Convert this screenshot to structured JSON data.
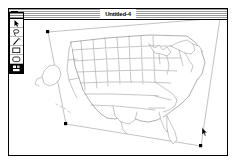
{
  "app": {
    "platform_style": "classic-mac-os",
    "background_color": "#ffffff"
  },
  "window": {
    "title": "Untitled-4",
    "close_box_label": "Close",
    "titlebar_stripe_color": "#9a9a9a",
    "frame_color": "#000000",
    "canvas_background": "#ffffff"
  },
  "palette": {
    "grip_label": "Drag palette",
    "tools": [
      {
        "name": "pointer-tool",
        "label": "Selection Arrow",
        "selected": false
      },
      {
        "name": "lasso-tool",
        "label": "Lasso",
        "selected": false
      },
      {
        "name": "magic-wand-tool",
        "label": "Magic Wand",
        "selected": false
      },
      {
        "name": "rectangle-tool",
        "label": "Rectangle",
        "selected": false
      },
      {
        "name": "rounded-rect-tool",
        "label": "Rounded Rect",
        "selected": false
      },
      {
        "name": "pattern-swatch",
        "label": "Fill Pattern",
        "selected": true
      }
    ]
  },
  "selection": {
    "label": "Selected graphic: United States map",
    "handle_color": "#000000",
    "outline_color": "#8c8c8c",
    "handles": [
      {
        "name": "handle-top-left",
        "x": 47,
        "y": 31
      },
      {
        "name": "handle-top-right",
        "x": 219,
        "y": 17
      },
      {
        "name": "handle-bottom-right",
        "x": 200,
        "y": 145
      },
      {
        "name": "handle-bottom-left",
        "x": 65,
        "y": 123
      }
    ]
  },
  "graphic": {
    "name": "us-states-map",
    "label": "United States state outlines",
    "stroke_color": "#7a7a7a",
    "fill_color": "#ffffff",
    "includes_alaska": true,
    "includes_hawaii": true
  },
  "cursor": {
    "name": "arrow-cursor",
    "x": 203,
    "y": 129
  }
}
